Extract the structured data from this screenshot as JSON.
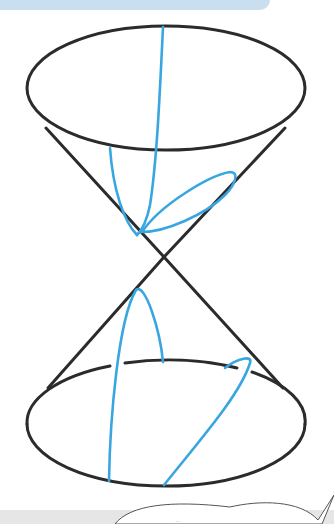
{
  "figure": {
    "colors": {
      "cone_outline": "#2b2b2b",
      "section_curves": "#3aa6e0",
      "banner": "#c9dff0",
      "footer_bar": "#e6e6e6"
    },
    "sections": [
      {
        "name": "circle-top-rim",
        "nappe": "upper"
      },
      {
        "name": "ellipse",
        "nappe": "upper"
      },
      {
        "name": "hyperbola",
        "nappe": "both"
      },
      {
        "name": "parabola",
        "nappe": "lower"
      },
      {
        "name": "ellipse-lower",
        "nappe": "lower"
      }
    ],
    "bubble_text": "…"
  }
}
